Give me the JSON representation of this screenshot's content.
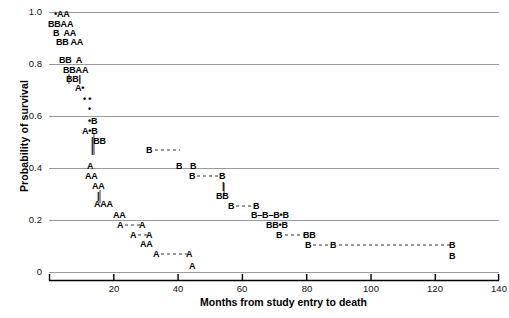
{
  "chart_data": {
    "type": "scatter",
    "title": "",
    "xlabel": "Months from study entry to death",
    "ylabel": "Probability of survival",
    "xlim": [
      0,
      140
    ],
    "ylim": [
      0,
      1.0
    ],
    "xticks": [
      0,
      20,
      40,
      60,
      80,
      100,
      120,
      140
    ],
    "xtick_labels": [
      "",
      "20",
      "40",
      "60",
      "80",
      "100",
      "120",
      "140"
    ],
    "yticks": [
      0,
      0.2,
      0.4,
      0.6,
      0.8,
      1.0
    ],
    "ytick_labels": [
      "0",
      "0.2",
      "0.4",
      "0.6",
      "0.8",
      "1.0"
    ],
    "grid": "horizontal",
    "legend": "none",
    "series": [
      {
        "name": "A",
        "marker": "A",
        "description": "Group A survival steps"
      },
      {
        "name": "B",
        "marker": "B",
        "description": "Group B survival steps"
      },
      {
        "name": "overlap",
        "marker": "dot",
        "description": "Overlapping A and B points"
      }
    ],
    "points": [
      {
        "x": 3,
        "y": 0.975,
        "label": "•AA"
      },
      {
        "x": 1,
        "y": 0.943,
        "label": "BBAA"
      },
      {
        "x": 3,
        "y": 0.91,
        "label": "B  AA"
      },
      {
        "x": 4,
        "y": 0.878,
        "label": "BB AA"
      },
      {
        "x": 4,
        "y": 0.805,
        "label": "BB  A"
      },
      {
        "x": 6,
        "y": 0.773,
        "label": "BBAA"
      },
      {
        "x": 8,
        "y": 0.742,
        "label": "BB|"
      },
      {
        "x": 10,
        "y": 0.71,
        "label": "A•"
      },
      {
        "x": 12,
        "y": 0.672,
        "label": "• •"
      },
      {
        "x": 13,
        "y": 0.635,
        "label": "•"
      },
      {
        "x": 13,
        "y": 0.597,
        "label": "•B"
      },
      {
        "x": 12,
        "y": 0.565,
        "label": "A•B"
      },
      {
        "x": 15,
        "y": 0.532,
        "label": "|BB"
      },
      {
        "x": 15,
        "y": 0.5,
        "label": "|  B–––––B"
      },
      {
        "x": 14,
        "y": 0.44,
        "label": "A"
      },
      {
        "x": 14,
        "y": 0.408,
        "label": "AA"
      },
      {
        "x": 16,
        "y": 0.375,
        "label": "AA"
      },
      {
        "x": 17,
        "y": 0.342,
        "label": "|"
      },
      {
        "x": 17,
        "y": 0.31,
        "label": "AAA"
      },
      {
        "x": 21,
        "y": 0.215,
        "label": "AA"
      },
      {
        "x": 22,
        "y": 0.183,
        "label": "A––A"
      },
      {
        "x": 25,
        "y": 0.152,
        "label": "A–A"
      },
      {
        "x": 27,
        "y": 0.12,
        "label": "AA"
      },
      {
        "x": 29,
        "y": 0.088,
        "label": "A––––A"
      },
      {
        "x": 35,
        "y": 0.04,
        "label": "A"
      },
      {
        "x": 40,
        "y": 0.44,
        "label": "B–B"
      },
      {
        "x": 42,
        "y": 0.408,
        "label": "B––––B"
      },
      {
        "x": 52,
        "y": 0.342,
        "label": "|"
      },
      {
        "x": 52,
        "y": 0.31,
        "label": "BB"
      },
      {
        "x": 56,
        "y": 0.25,
        "label": "B–––B"
      },
      {
        "x": 62,
        "y": 0.215,
        "label": "B–B–B•B"
      },
      {
        "x": 68,
        "y": 0.183,
        "label": "BB•B"
      },
      {
        "x": 72,
        "y": 0.152,
        "label": "B–––BB"
      },
      {
        "x": 80,
        "y": 0.12,
        "label": "B–––B––––––––––––B"
      },
      {
        "x": 120,
        "y": 0.088,
        "label": "B"
      }
    ]
  },
  "axes": {
    "ylabel": "Probability of survival",
    "xlabel": "Months from study entry to death",
    "ytick_labels": [
      "1.0",
      "0.8",
      "0.6",
      "0.4",
      "0.2",
      "0"
    ],
    "xtick_labels": [
      "20",
      "40",
      "60",
      "80",
      "100",
      "120",
      "140"
    ]
  },
  "colors": {
    "gridline": "#9a9a9a",
    "axis": "#000000",
    "text": "#000000",
    "marker": "#000000"
  },
  "caption": {
    "text": ""
  },
  "markers": [
    {
      "name": "row-1",
      "text": "•AA",
      "left": 54,
      "top": 10
    },
    {
      "name": "row-2",
      "text": "BBAA",
      "left": 48,
      "top": 20
    },
    {
      "name": "row-3",
      "text": "B  AA",
      "left": 53,
      "top": 29
    },
    {
      "name": "row-4",
      "text": "BB AA",
      "left": 56,
      "top": 38
    },
    {
      "name": "row-5",
      "text": "BB  A",
      "left": 59,
      "top": 56
    },
    {
      "name": "row-6",
      "text": "BBAA",
      "left": 63,
      "top": 66
    },
    {
      "name": "row-7",
      "text": "BB|",
      "left": 66,
      "top": 75
    },
    {
      "name": "row-8",
      "text": "A•",
      "left": 75,
      "top": 84
    },
    {
      "name": "row-9",
      "text": "• •",
      "left": 83,
      "top": 95
    },
    {
      "name": "row-10",
      "text": "•",
      "left": 88,
      "top": 105
    },
    {
      "name": "row-11",
      "text": "•B",
      "left": 88,
      "top": 117
    },
    {
      "name": "row-12",
      "text": "A•B",
      "left": 82,
      "top": 127
    },
    {
      "name": "row-13",
      "text": "|BB",
      "left": 91,
      "top": 137
    },
    {
      "name": "row-14",
      "text": "|",
      "left": 91,
      "top": 146
    },
    {
      "name": "row-15",
      "text": "A",
      "left": 87,
      "top": 162
    },
    {
      "name": "row-16",
      "text": "AA",
      "left": 85,
      "top": 172
    },
    {
      "name": "row-17",
      "text": "AA",
      "left": 92,
      "top": 182
    },
    {
      "name": "row-18",
      "text": "|",
      "left": 97,
      "top": 192
    },
    {
      "name": "row-19",
      "text": "AAA",
      "left": 94,
      "top": 200
    },
    {
      "name": "row-20",
      "text": "AA",
      "left": 113,
      "top": 211
    },
    {
      "name": "row-21",
      "text": "A",
      "left": 117,
      "top": 221
    },
    {
      "name": "row-22",
      "text": "A",
      "left": 139,
      "top": 221
    },
    {
      "name": "row-23",
      "text": "A",
      "left": 130,
      "top": 231
    },
    {
      "name": "row-24",
      "text": "A",
      "left": 146,
      "top": 231
    },
    {
      "name": "row-25",
      "text": "AA",
      "left": 140,
      "top": 240
    },
    {
      "name": "row-26",
      "text": "A",
      "left": 153,
      "top": 250
    },
    {
      "name": "row-27",
      "text": "A",
      "left": 186,
      "top": 250
    },
    {
      "name": "row-28",
      "text": "A",
      "left": 189,
      "top": 262
    },
    {
      "name": "row-b1",
      "text": "B",
      "left": 146,
      "top": 146
    },
    {
      "name": "row-b2",
      "text": "B",
      "left": 176,
      "top": 162
    },
    {
      "name": "row-b3",
      "text": "B",
      "left": 190,
      "top": 162
    },
    {
      "name": "row-b4",
      "text": "B",
      "left": 189,
      "top": 172
    },
    {
      "name": "row-b5",
      "text": "B",
      "left": 219,
      "top": 172
    },
    {
      "name": "row-b6",
      "text": "|",
      "left": 222,
      "top": 182
    },
    {
      "name": "row-b7",
      "text": "BB",
      "left": 216,
      "top": 192
    },
    {
      "name": "row-b8",
      "text": "B",
      "left": 228,
      "top": 202
    },
    {
      "name": "row-b9",
      "text": "B",
      "left": 253,
      "top": 202
    },
    {
      "name": "row-b10",
      "text": "B–B–B•B",
      "left": 251,
      "top": 211
    },
    {
      "name": "row-b11",
      "text": "BB•B",
      "left": 266,
      "top": 221
    },
    {
      "name": "row-b12",
      "text": "B",
      "left": 276,
      "top": 231
    },
    {
      "name": "row-b13",
      "text": "BB",
      "left": 303,
      "top": 231
    },
    {
      "name": "row-b14",
      "text": "B",
      "left": 305,
      "top": 241
    },
    {
      "name": "row-b15",
      "text": "B",
      "left": 330,
      "top": 241
    },
    {
      "name": "row-b16",
      "text": "B",
      "left": 449,
      "top": 241
    },
    {
      "name": "row-b17",
      "text": "B",
      "left": 449,
      "top": 252
    }
  ]
}
